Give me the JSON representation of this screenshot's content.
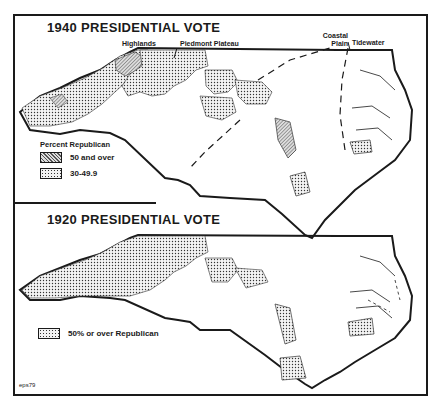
{
  "map_1940": {
    "title": "1940 PRESIDENTIAL VOTE",
    "region_labels": {
      "highlands": "Highlands",
      "piedmont": "Piedmont Plateau",
      "coastal_plain": "Coastal Plain",
      "tidewater": "Tidewater"
    },
    "legend": {
      "title": "Percent Republican",
      "items": [
        {
          "label": "50 and over",
          "pattern": "hatched"
        },
        {
          "label": "30-49.9",
          "pattern": "dotted"
        }
      ]
    }
  },
  "map_1920": {
    "title": "1920 PRESIDENTIAL VOTE",
    "legend": {
      "items": [
        {
          "label": "50% or over Republican",
          "pattern": "dotted"
        }
      ]
    }
  },
  "footer": {
    "code": "eps79"
  },
  "colors": {
    "ink": "#1a1a1a",
    "background": "#ffffff",
    "hatch": "#555555",
    "dot_fill": "#f2f2f2"
  }
}
